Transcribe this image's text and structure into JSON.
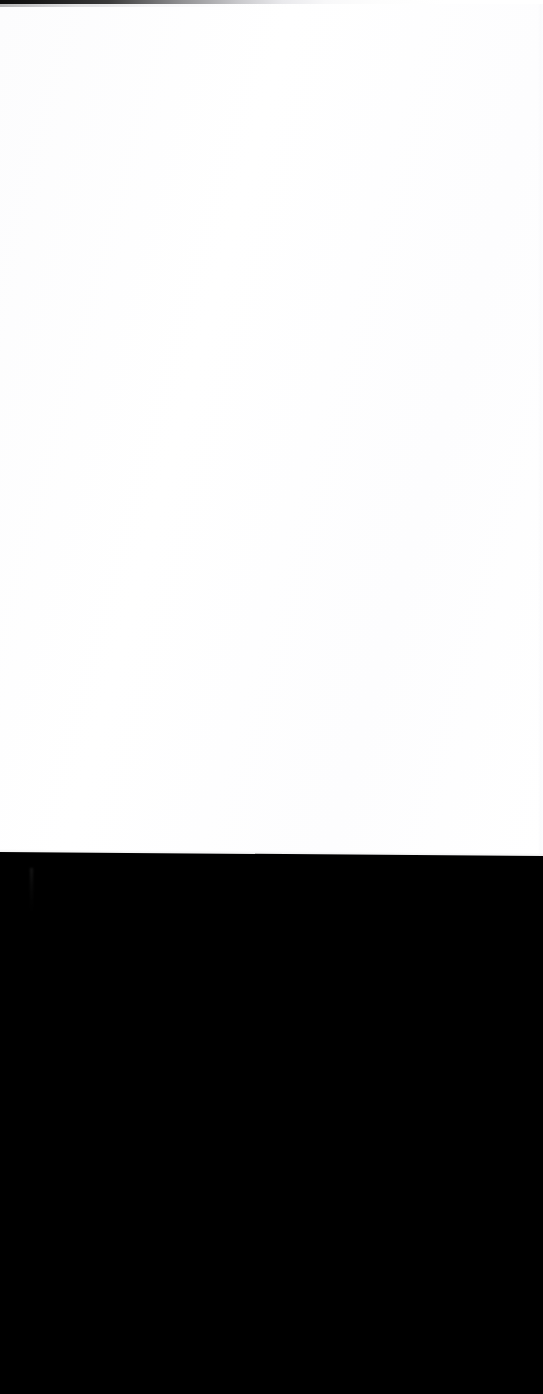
{
  "capture": {
    "kind": "blank-viewport-capture",
    "width_px": 543,
    "height_px": 1394,
    "visible_text": "",
    "notes_label": ""
  },
  "regions": {
    "top_band": {
      "name": "top-edge-band",
      "label": "",
      "color_left": "#0b0b0b",
      "color_mid": "#8e8e90",
      "color_right": "#ffffff",
      "height_px": 4,
      "fade_end_x_px": 270
    },
    "content_pane": {
      "name": "blank-content-pane",
      "label": "",
      "background": "#ffffff",
      "top_px": 4,
      "bottom_px": 853,
      "content": ""
    },
    "right_edge_strip": {
      "name": "right-edge-strip",
      "label": "",
      "color": "#fafafb",
      "width_px": 5
    },
    "seam": {
      "name": "pane-boundary-seam",
      "label": "",
      "left_y_px": 852,
      "right_y_px": 856,
      "color": "#1a1a1a"
    },
    "black_region": {
      "name": "black-fill-region",
      "label": "",
      "background": "#000000",
      "top_px": 853,
      "bottom_px": 1394,
      "content": ""
    },
    "artifact": {
      "name": "faint-vertical-artifact",
      "label": "",
      "color": "#1a1a1a",
      "x_px": 30,
      "y_px": 868,
      "width_px": 3,
      "height_px": 46
    }
  }
}
